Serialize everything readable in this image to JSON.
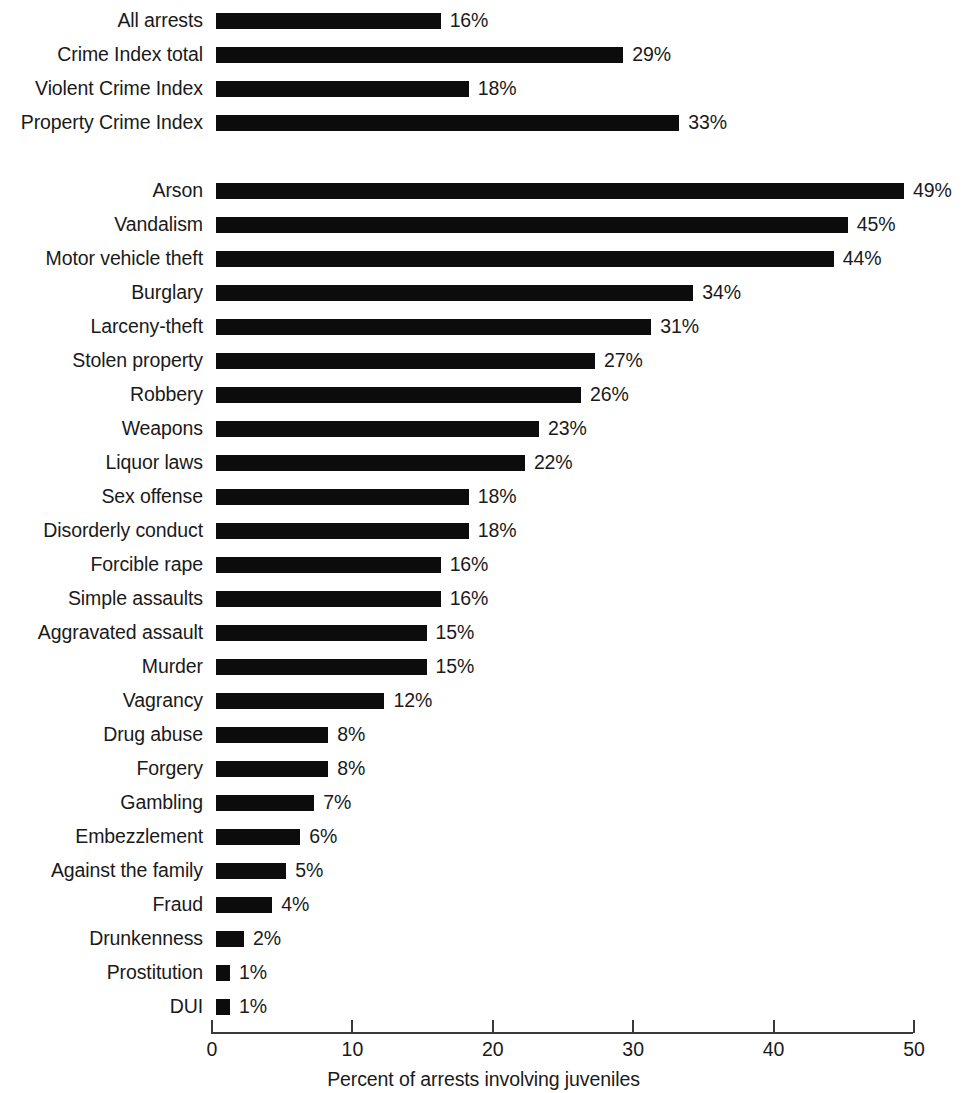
{
  "chart_data": {
    "type": "bar",
    "orientation": "horizontal",
    "title": "",
    "xlabel": "Percent of arrests involving juveniles",
    "ylabel": "",
    "xlim": [
      0,
      50
    ],
    "xticks": [
      "0",
      "10",
      "20",
      "30",
      "40",
      "50"
    ],
    "grid": false,
    "legend": null,
    "value_suffix": "%",
    "bar_color": "#0c0c0c",
    "axis_color": "#3a3a3a",
    "categories": [
      "All arrests",
      "Crime Index total",
      "Violent Crime Index",
      "Property Crime Index",
      "Arson",
      "Vandalism",
      "Motor vehicle theft",
      "Burglary",
      "Larceny-theft",
      "Stolen property",
      "Robbery",
      "Weapons",
      "Liquor laws",
      "Sex offense",
      "Disorderly conduct",
      "Forcible rape",
      "Simple assaults",
      "Aggravated assault",
      "Murder",
      "Vagrancy",
      "Drug abuse",
      "Forgery",
      "Gambling",
      "Embezzlement",
      "Against the family",
      "Fraud",
      "Drunkenness",
      "Prostitution",
      "DUI"
    ],
    "values": [
      16,
      29,
      18,
      33,
      49,
      45,
      44,
      34,
      31,
      27,
      26,
      23,
      22,
      18,
      18,
      16,
      16,
      15,
      15,
      12,
      8,
      8,
      7,
      6,
      5,
      4,
      2,
      1,
      1
    ],
    "value_labels": [
      "16%",
      "29%",
      "18%",
      "33%",
      "49%",
      "45%",
      "44%",
      "34%",
      "31%",
      "27%",
      "26%",
      "23%",
      "22%",
      "18%",
      "18%",
      "16%",
      "16%",
      "15%",
      "15%",
      "12%",
      "8%",
      "8%",
      "7%",
      "6%",
      "5%",
      "4%",
      "2%",
      "1%",
      "1%"
    ],
    "group_break_after_index": 3
  }
}
